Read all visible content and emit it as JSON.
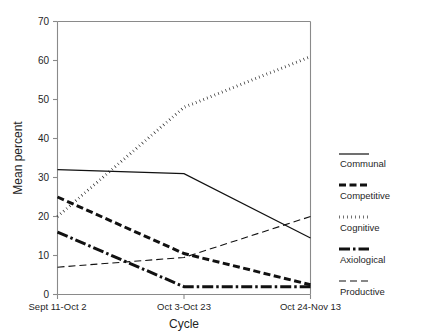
{
  "chart_data": {
    "type": "line",
    "title": "",
    "xlabel": "Cycle",
    "ylabel": "Mean percent",
    "categories": [
      "Sept 11-Oct 2",
      "Oct 3-Oct 23",
      "Oct 24-Nov 13"
    ],
    "yticks": [
      0,
      10,
      20,
      30,
      40,
      50,
      60,
      70
    ],
    "ylim": [
      0,
      70
    ],
    "grid": false,
    "legend_position": "right",
    "series": [
      {
        "name": "Communal",
        "values": [
          32,
          31,
          14.5
        ],
        "line_style": "solid",
        "line_width": 1.2,
        "color": "#111111"
      },
      {
        "name": "Competitive",
        "values": [
          25,
          10.5,
          2.5
        ],
        "line_style": "dashed",
        "line_width": 3.0,
        "color": "#111111"
      },
      {
        "name": "Cognitive",
        "values": [
          20,
          48,
          61
        ],
        "line_style": "dotted",
        "line_width": 3.0,
        "color": "#111111"
      },
      {
        "name": "Axiological",
        "values": [
          16,
          2,
          2
        ],
        "line_style": "dashdot",
        "line_width": 3.0,
        "color": "#111111"
      },
      {
        "name": "Productive",
        "values": [
          7,
          9.5,
          20
        ],
        "line_style": "thin-dashed",
        "line_width": 1.1,
        "color": "#111111"
      }
    ]
  },
  "axis": {
    "y_title": "Mean percent",
    "x_title": "Cycle",
    "tick_labels_y": [
      "70",
      "60",
      "50",
      "40",
      "30",
      "20",
      "10",
      "0"
    ],
    "tick_labels_x": [
      "Sept 11-Oct 2",
      "Oct 3-Oct 23",
      "Oct 24-Nov 13"
    ]
  },
  "legend": {
    "entries": [
      {
        "label": "Communal"
      },
      {
        "label": "Competitive"
      },
      {
        "label": "Cognitive"
      },
      {
        "label": "Axiological"
      },
      {
        "label": "Productive"
      }
    ]
  }
}
